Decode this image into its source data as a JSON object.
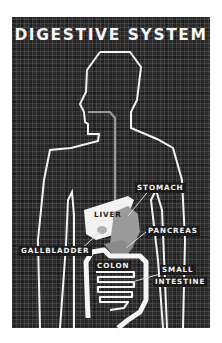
{
  "diagram": {
    "title": "DIGESTIVE SYSTEM",
    "background_color": "#2a2a2a",
    "outline_color": "#f4f4f4",
    "organ_fill_gray": "#9a9a9a",
    "labels": {
      "stomach": "STOMACH",
      "liver": "LIVER",
      "pancreas": "PANCREAS",
      "gallbladder": "GALLBLADDER",
      "colon": "COLON",
      "small": "SMALL",
      "intestine": "INTESTINE"
    }
  }
}
